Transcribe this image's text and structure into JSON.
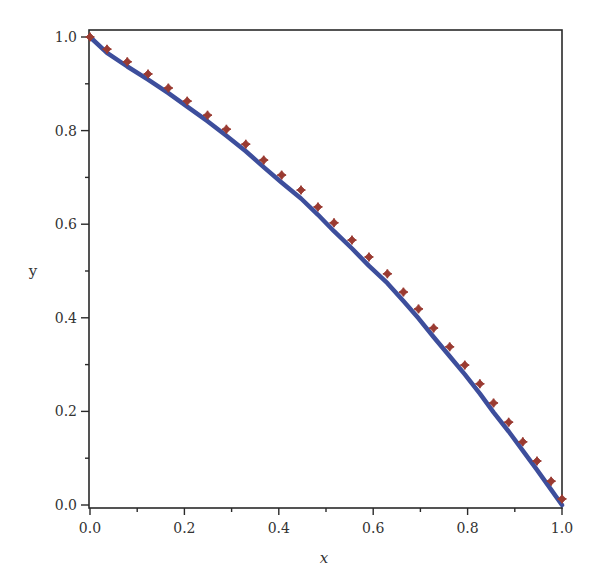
{
  "chart_data": {
    "type": "line",
    "title": "",
    "xlabel": "x",
    "ylabel": "y",
    "xlim": [
      0,
      1
    ],
    "ylim": [
      0,
      1
    ],
    "grid": false,
    "legend": null,
    "x_ticks": [
      {
        "value": 0.0,
        "label": "0.0"
      },
      {
        "value": 0.2,
        "label": "0.2"
      },
      {
        "value": 0.4,
        "label": "0.4"
      },
      {
        "value": 0.6,
        "label": "0.6"
      },
      {
        "value": 0.8,
        "label": "0.8"
      },
      {
        "value": 1.0,
        "label": "1.0"
      }
    ],
    "x_minor_ticks": [
      0.1,
      0.3,
      0.5,
      0.7,
      0.9
    ],
    "y_ticks": [
      {
        "value": 0.0,
        "label": "0.0"
      },
      {
        "value": 0.2,
        "label": "0.2"
      },
      {
        "value": 0.4,
        "label": "0.4"
      },
      {
        "value": 0.6,
        "label": "0.6"
      },
      {
        "value": 0.8,
        "label": "0.8"
      },
      {
        "value": 1.0,
        "label": "1.0"
      }
    ],
    "y_minor_ticks": [
      0.1,
      0.3,
      0.5,
      0.7,
      0.9
    ],
    "series": [
      {
        "name": "curve",
        "style": "line",
        "color": "#3d4e9c",
        "width": 4.5,
        "x": [
          0.0,
          0.036,
          0.079,
          0.123,
          0.166,
          0.206,
          0.249,
          0.289,
          0.33,
          0.368,
          0.406,
          0.447,
          0.483,
          0.517,
          0.555,
          0.591,
          0.63,
          0.664,
          0.696,
          0.728,
          0.762,
          0.794,
          0.826,
          0.855,
          0.887,
          0.917,
          0.947,
          0.977,
          1.0
        ],
        "y": [
          1.0,
          0.966,
          0.937,
          0.909,
          0.88,
          0.851,
          0.82,
          0.789,
          0.756,
          0.722,
          0.689,
          0.655,
          0.62,
          0.585,
          0.548,
          0.511,
          0.474,
          0.436,
          0.399,
          0.359,
          0.318,
          0.279,
          0.238,
          0.198,
          0.157,
          0.116,
          0.075,
          0.033,
          0.0
        ]
      },
      {
        "name": "points",
        "style": "markers",
        "marker": "diamond-cross",
        "color": "#9a3b32",
        "x": [
          0.0,
          0.036,
          0.079,
          0.123,
          0.166,
          0.206,
          0.249,
          0.289,
          0.33,
          0.368,
          0.406,
          0.447,
          0.483,
          0.517,
          0.555,
          0.591,
          0.63,
          0.664,
          0.696,
          0.728,
          0.762,
          0.794,
          0.826,
          0.855,
          0.887,
          0.917,
          0.947,
          0.977,
          1.0
        ],
        "y": [
          1.0,
          0.974,
          0.947,
          0.921,
          0.891,
          0.863,
          0.833,
          0.803,
          0.771,
          0.737,
          0.705,
          0.673,
          0.637,
          0.603,
          0.566,
          0.53,
          0.494,
          0.455,
          0.419,
          0.378,
          0.338,
          0.299,
          0.259,
          0.218,
          0.177,
          0.135,
          0.094,
          0.051,
          0.013
        ]
      }
    ]
  },
  "colors": {
    "frame": "#2a2a2a",
    "line": "#3d4e9c",
    "marker": "#9a3b32",
    "text": "#333333"
  }
}
